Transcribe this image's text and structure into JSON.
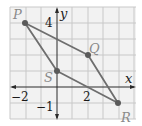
{
  "diagram": {
    "type": "coordinate-plane-quadrilateral",
    "axes": {
      "x_label": "x",
      "y_label": "y",
      "tick_labels": {
        "x_neg2": "−2",
        "x_2": "2",
        "y_4": "4",
        "y_neg1": "−1"
      }
    },
    "grid": {
      "x_range": [
        -3,
        5
      ],
      "y_range": [
        -2,
        5
      ],
      "step": 1
    },
    "points": [
      {
        "name": "P",
        "x": -2,
        "y": 5
      },
      {
        "name": "Q",
        "x": 2,
        "y": 3
      },
      {
        "name": "R",
        "x": 4,
        "y": -1
      },
      {
        "name": "S",
        "x": 0,
        "y": 2
      }
    ],
    "polygon_order": [
      "P",
      "Q",
      "R",
      "S"
    ],
    "colors": {
      "grid": "#c8c8c8",
      "axis": "#2a2a2a",
      "edge": "#6e6e6e",
      "point": "#5a5a5a",
      "label": "#8a8a8a"
    }
  }
}
